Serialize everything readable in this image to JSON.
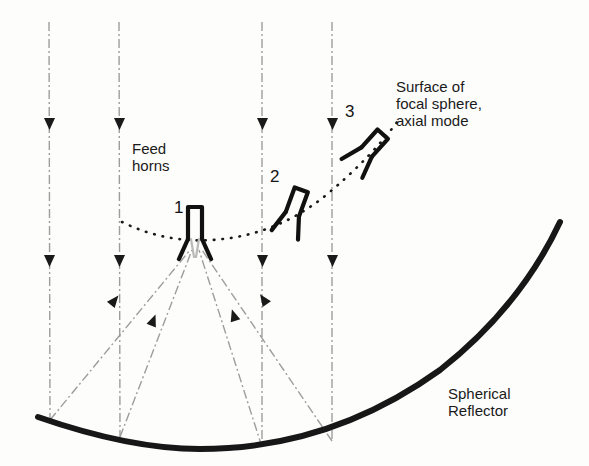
{
  "figure": {
    "background_color": "#fdfdfc",
    "ink_color": "#1a1a1a",
    "ray_color": "#9a9a9a",
    "width": 589,
    "height": 466
  },
  "labels": {
    "feed_horns": "Feed\nhorns",
    "focal_sphere": "Surface of\nfocal sphere,\naxial mode",
    "spherical_reflector": "Spherical\nReflector"
  },
  "horns": [
    {
      "number": "1",
      "tilt_degrees": 0,
      "aperture_x": 195,
      "aperture_y": 243,
      "label_x": 174,
      "label_y": 199
    },
    {
      "number": "2",
      "tilt_degrees": 20,
      "aperture_x": 291,
      "aperture_y": 222,
      "label_x": 270,
      "label_y": 168
    },
    {
      "number": "3",
      "tilt_degrees": 42,
      "aperture_x": 366,
      "aperture_y": 160,
      "label_x": 345,
      "label_y": 103
    }
  ],
  "incoming_rays": {
    "style": "dash-dot",
    "direction": "downward",
    "count": 4,
    "x_positions": [
      49,
      119,
      262,
      332
    ],
    "top_y": 22,
    "arrowhead_y_positions": [
      125,
      262
    ]
  },
  "reflected_rays": {
    "style": "dash-dot",
    "direction": "toward-focus",
    "count": 4,
    "focus_x": 195,
    "focus_y": 243,
    "reflection_points": [
      {
        "x": 50,
        "y": 420
      },
      {
        "x": 120,
        "y": 437
      },
      {
        "x": 262,
        "y": 447
      },
      {
        "x": 332,
        "y": 441
      }
    ]
  },
  "reflector": {
    "style": "solid-thick",
    "stroke_width": 6,
    "left_end": {
      "x": 38,
      "y": 417
    },
    "vertex": {
      "x": 200,
      "y": 449
    },
    "right_end": {
      "x": 560,
      "y": 222
    }
  },
  "focal_sphere_arc": {
    "style": "dotted",
    "left_end": {
      "x": 122,
      "y": 222
    },
    "low_point": {
      "x": 210,
      "y": 240
    },
    "right_end": {
      "x": 400,
      "y": 118
    }
  }
}
